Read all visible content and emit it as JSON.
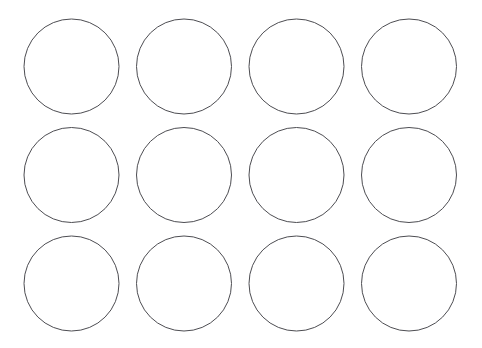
{
  "page": {
    "kind": "printable-template",
    "width": 482,
    "height": 348,
    "background_color": "#ffffff"
  },
  "template": {
    "description": "Grid of blank outline circles for labels or stickers",
    "columns": 4,
    "rows": 3,
    "total_circles": 12,
    "circle_diameter": 95,
    "circle_radius": 47.5,
    "stroke_color": "#4d4d52",
    "stroke_width": 1,
    "fill_color": "#ffffff",
    "column_pitch": 112.5,
    "row_pitch": 108.5,
    "margin_left": 24,
    "margin_right": 24,
    "margin_top": 19,
    "margin_bottom": 17,
    "column_gap": 17.5,
    "row_gap": 13.5,
    "column_centers": [
      71.5,
      184,
      296.5,
      409
    ],
    "row_centers": [
      66.5,
      175,
      283.5
    ]
  },
  "circles": [
    {
      "id": "circle-r1-c1",
      "row": 1,
      "col": 1,
      "cx": 71.5,
      "cy": 66.5,
      "r": 47.5,
      "label": ""
    },
    {
      "id": "circle-r1-c2",
      "row": 1,
      "col": 2,
      "cx": 184,
      "cy": 66.5,
      "r": 47.5,
      "label": ""
    },
    {
      "id": "circle-r1-c3",
      "row": 1,
      "col": 3,
      "cx": 296.5,
      "cy": 66.5,
      "r": 47.5,
      "label": ""
    },
    {
      "id": "circle-r1-c4",
      "row": 1,
      "col": 4,
      "cx": 409,
      "cy": 66.5,
      "r": 47.5,
      "label": ""
    },
    {
      "id": "circle-r2-c1",
      "row": 2,
      "col": 1,
      "cx": 71.5,
      "cy": 175,
      "r": 47.5,
      "label": ""
    },
    {
      "id": "circle-r2-c2",
      "row": 2,
      "col": 2,
      "cx": 184,
      "cy": 175,
      "r": 47.5,
      "label": ""
    },
    {
      "id": "circle-r2-c3",
      "row": 2,
      "col": 3,
      "cx": 296.5,
      "cy": 175,
      "r": 47.5,
      "label": ""
    },
    {
      "id": "circle-r2-c4",
      "row": 2,
      "col": 4,
      "cx": 409,
      "cy": 175,
      "r": 47.5,
      "label": ""
    },
    {
      "id": "circle-r3-c1",
      "row": 3,
      "col": 1,
      "cx": 71.5,
      "cy": 283.5,
      "r": 47.5,
      "label": ""
    },
    {
      "id": "circle-r3-c2",
      "row": 3,
      "col": 2,
      "cx": 184,
      "cy": 283.5,
      "r": 47.5,
      "label": ""
    },
    {
      "id": "circle-r3-c3",
      "row": 3,
      "col": 3,
      "cx": 296.5,
      "cy": 283.5,
      "r": 47.5,
      "label": ""
    },
    {
      "id": "circle-r3-c4",
      "row": 3,
      "col": 4,
      "cx": 409,
      "cy": 283.5,
      "r": 47.5,
      "label": ""
    }
  ]
}
